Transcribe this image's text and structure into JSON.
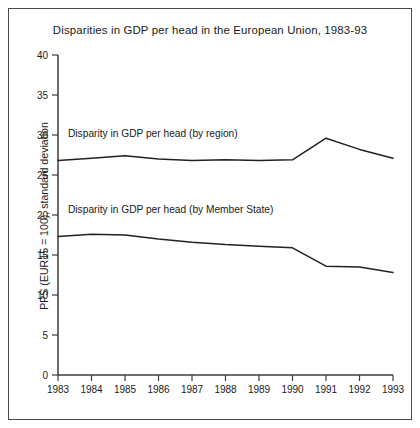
{
  "chart_data": {
    "type": "line",
    "title": "Disparities in GDP per head in the European Union, 1983-93",
    "xlabel": "",
    "ylabel": "PPS (EUR15 = 100), standard deviation",
    "categories": [
      "1983",
      "1984",
      "1985",
      "1986",
      "1987",
      "1988",
      "1989",
      "1990",
      "1991",
      "1992",
      "1993"
    ],
    "x": [
      1983,
      1984,
      1985,
      1986,
      1987,
      1988,
      1989,
      1990,
      1991,
      1992,
      1993
    ],
    "ylim": [
      0,
      40
    ],
    "yticks": [
      0,
      5,
      10,
      15,
      20,
      25,
      30,
      35,
      40
    ],
    "ytick_labels": [
      "0",
      "5",
      "10",
      "15",
      "20",
      "25",
      "30",
      "35",
      "40"
    ],
    "grid": false,
    "legend_position": "inline-annotations",
    "series": [
      {
        "name": "Disparity in GDP per head (by region)",
        "values": [
          26.8,
          27.1,
          27.4,
          27.0,
          26.8,
          26.9,
          26.8,
          26.9,
          29.6,
          28.2,
          27.1
        ]
      },
      {
        "name": "Disparity in GDP per head (by Member State)",
        "values": [
          17.3,
          17.6,
          17.5,
          17.0,
          16.6,
          16.3,
          16.1,
          15.9,
          13.6,
          13.5,
          12.8
        ]
      }
    ],
    "annotations": [
      {
        "text": "Disparity in GDP per head (by region)",
        "series": "Disparity in GDP per head (by region)"
      },
      {
        "text": "Disparity in GDP per head (by Member State)",
        "series": "Disparity in GDP per head (by Member State)"
      }
    ]
  },
  "colors": {
    "line": "#222222",
    "axis": "#3c3c3c",
    "frame": "#4a4a4a",
    "text": "#1a1a1a",
    "background": "#ffffff"
  }
}
